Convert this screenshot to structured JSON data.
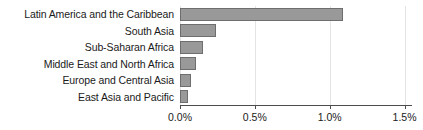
{
  "chart_data": {
    "type": "bar",
    "orientation": "horizontal",
    "title": "",
    "subtitle": "",
    "xlabel": "",
    "ylabel": "",
    "categories": [
      "Latin America and the Caribbean",
      "South Asia",
      "Sub-Saharan Africa",
      "Middle East and North Africa",
      "Europe and Central Asia",
      "East Asia and Pacific"
    ],
    "values": [
      1.09,
      0.24,
      0.155,
      0.105,
      0.073,
      0.053
    ],
    "value_unit": "%",
    "xlim": [
      0.0,
      1.55
    ],
    "xticks": [
      0.0,
      0.5,
      1.0,
      1.5
    ],
    "xtick_labels": [
      "0.0%",
      "0.5%",
      "1.0%",
      "1.5%"
    ],
    "grid": true,
    "grid_axis": "x",
    "legend": false,
    "series": [
      {
        "name": "",
        "values": [
          1.09,
          0.24,
          0.155,
          0.105,
          0.073,
          0.053
        ],
        "bar_color": "#999999",
        "bar_border_color": "#6e6e6e"
      }
    ],
    "colors": {
      "bar_fill": "#999999",
      "bar_border": "#6e6e6e",
      "axis": "#4d4d4d",
      "grid": "#e4e4e4",
      "text": "#1a1a1a",
      "background": "#ffffff"
    }
  }
}
